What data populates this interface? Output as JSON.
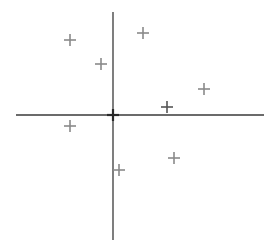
{
  "chart_data": {
    "type": "scatter",
    "title": "",
    "xlabel": "",
    "ylabel": "",
    "xlim": [
      -97,
      151
    ],
    "ylim": [
      -125,
      103
    ],
    "grid": false,
    "legend": null,
    "axes": {
      "origin": [
        0,
        0
      ],
      "color": "#3a3a3a"
    },
    "marker": "+",
    "series": [
      {
        "name": "points",
        "color": "#8a8a8a",
        "points": [
          {
            "x": -43,
            "y": 75
          },
          {
            "x": -12,
            "y": 51
          },
          {
            "x": 30,
            "y": 82
          },
          {
            "x": 91,
            "y": 26
          },
          {
            "x": 54,
            "y": 8,
            "color": "#555555"
          },
          {
            "x": -43,
            "y": -11
          },
          {
            "x": 6,
            "y": -55
          },
          {
            "x": 61,
            "y": -43
          }
        ]
      },
      {
        "name": "origin",
        "color": "#2a2a2a",
        "points": [
          {
            "x": 0,
            "y": 0
          }
        ]
      }
    ]
  },
  "layout": {
    "origin_px": [
      113,
      115
    ],
    "marker_half_size": 6
  }
}
